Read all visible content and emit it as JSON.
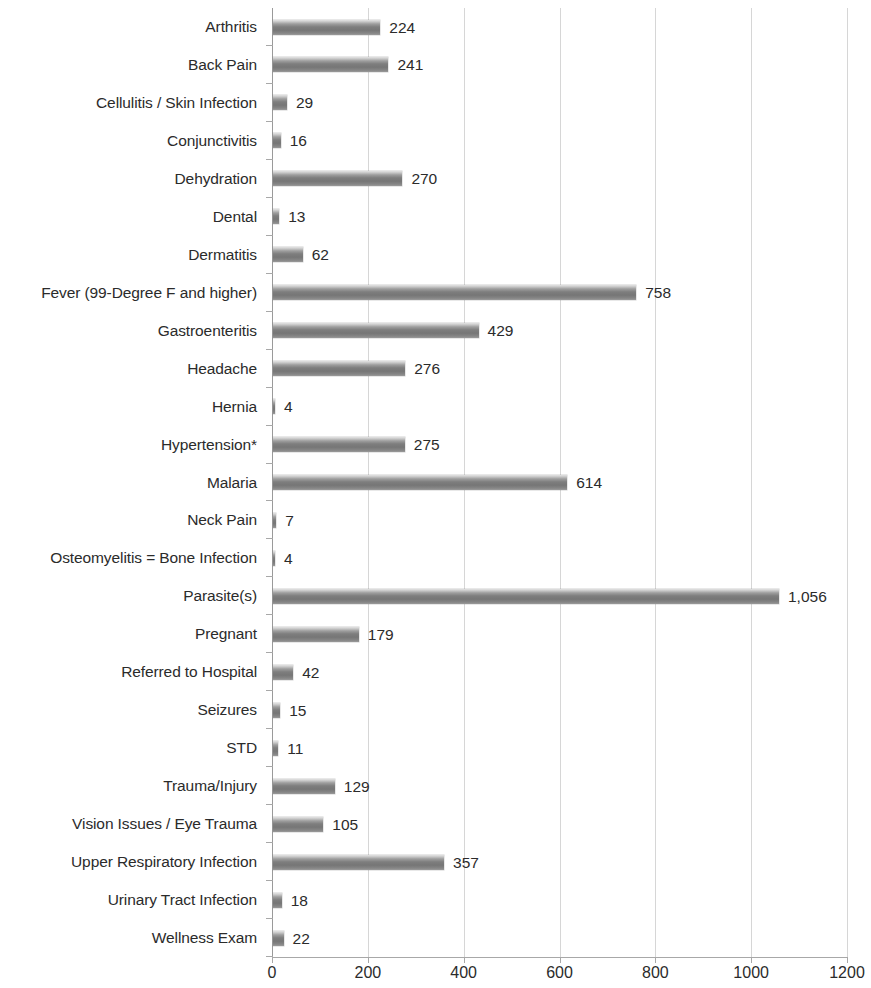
{
  "chart_data": {
    "type": "bar",
    "orientation": "horizontal",
    "title": "",
    "subtitle": "",
    "xlabel": "",
    "ylabel": "",
    "xlim": [
      0,
      1200
    ],
    "xticks": [
      "0",
      "200",
      "400",
      "600",
      "800",
      "1000",
      "1200"
    ],
    "xtick_values": [
      0,
      200,
      400,
      600,
      800,
      1000,
      1200
    ],
    "grid": "vertical",
    "legend": "none",
    "bar_color": "#7e7e7e",
    "bar_highlight_color": "#e3e3e3",
    "gridline_color": "#d6d6d6",
    "axis_color": "#9a9a9a",
    "text_color": "#2b2b2b",
    "categories": [
      "Arthritis",
      "Back Pain",
      "Cellulitis / Skin Infection",
      "Conjunctivitis",
      "Dehydration",
      "Dental",
      "Dermatitis",
      "Fever (99-Degree F and higher)",
      "Gastroenteritis",
      "Headache",
      "Hernia",
      "Hypertension*",
      "Malaria",
      "Neck Pain",
      "Osteomyelitis = Bone Infection",
      "Parasite(s)",
      "Pregnant",
      "Referred to Hospital",
      "Seizures",
      "STD",
      "Trauma/Injury",
      "Vision Issues / Eye Trauma",
      "Upper Respiratory Infection",
      "Urinary Tract Infection",
      "Wellness Exam"
    ],
    "values": [
      224,
      241,
      29,
      16,
      270,
      13,
      62,
      758,
      429,
      276,
      4,
      275,
      614,
      7,
      4,
      1056,
      179,
      42,
      15,
      11,
      129,
      105,
      357,
      18,
      22
    ],
    "value_labels": [
      "224",
      "241",
      "29",
      "16",
      "270",
      "13",
      "62",
      "758",
      "429",
      "276",
      "4",
      "275",
      "614",
      "7",
      "4",
      "1,056",
      "179",
      "42",
      "15",
      "11",
      "129",
      "105",
      "357",
      "18",
      "22"
    ]
  }
}
